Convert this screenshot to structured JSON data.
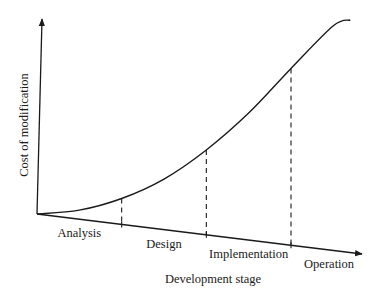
{
  "chart_data": {
    "type": "line",
    "title": "",
    "xlabel": "Development stage",
    "ylabel": "Cost of modification",
    "categories": [
      "Analysis",
      "Design",
      "Implementation",
      "Operation"
    ],
    "stage_boundaries": [
      1,
      2,
      3
    ],
    "x_range": [
      0,
      3.7
    ],
    "y_range": [
      0,
      1
    ],
    "series": [
      {
        "name": "Cost of modification",
        "x": [
          0,
          0.5,
          1,
          1.5,
          2,
          2.5,
          3,
          3.5,
          3.7
        ],
        "values": [
          0,
          0.02,
          0.08,
          0.18,
          0.33,
          0.52,
          0.75,
          0.97,
          1.0
        ]
      }
    ],
    "grid": false,
    "legend": "none"
  }
}
